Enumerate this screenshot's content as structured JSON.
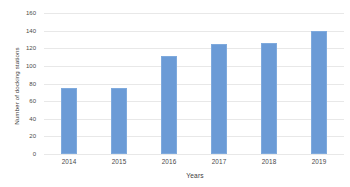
{
  "chart_data": {
    "type": "bar",
    "title": "",
    "xlabel": "Years",
    "ylabel": "Number of docking stations",
    "categories": [
      "2014",
      "2015",
      "2016",
      "2017",
      "2018",
      "2019"
    ],
    "values": [
      75,
      75,
      111,
      125,
      126,
      140
    ],
    "series": [
      {
        "name": "Number of docking stations",
        "values": [
          75,
          75,
          111,
          125,
          126,
          140
        ]
      }
    ],
    "ylim": [
      0,
      160
    ],
    "yticks": [
      0,
      20,
      40,
      60,
      80,
      100,
      120,
      140,
      160
    ],
    "ytick_labels": [
      "0",
      "20",
      "40",
      "60",
      "80",
      "100",
      "120",
      "140",
      "160"
    ],
    "xtick_labels": [
      "2014",
      "2015",
      "2016",
      "2017",
      "2018",
      "2019"
    ],
    "grid": true,
    "grid_axis": "y",
    "legend": false,
    "legend_position": "none",
    "bar_color": "#6b9bd6",
    "gridline_color": "#e8e8e8",
    "text_color": "#4a4a4a",
    "background_color": "#ffffff"
  }
}
